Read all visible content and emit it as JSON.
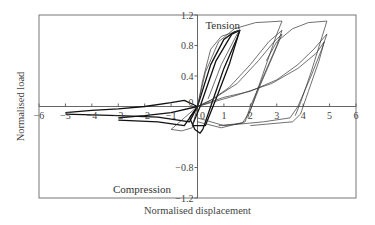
{
  "chart_data": {
    "type": "line",
    "title": "",
    "xlabel": "Normalised displacement",
    "ylabel": "Normalised load",
    "xlim": [
      -6,
      6
    ],
    "ylim": [
      -1.2,
      1.2
    ],
    "x_ticks": [
      -6,
      -5,
      -4,
      -3,
      -2,
      -1,
      0,
      1,
      2,
      3,
      4,
      5,
      6
    ],
    "y_ticks": [
      -1.2,
      -0.8,
      0,
      0.4,
      0.8,
      1.2
    ],
    "y_tick_labels": [
      "−1.2",
      "−0.8",
      "0",
      "0.4",
      "0.8",
      "1.2"
    ],
    "x_tick_labels": [
      "−6",
      "−5",
      "−4",
      "−3",
      "−2",
      "−1",
      "0",
      "1",
      "2",
      "3",
      "4",
      "5",
      "6"
    ],
    "grid": false,
    "legend": null,
    "annotations": [
      {
        "text": "Tension",
        "x": 0.3,
        "y": 1.12
      },
      {
        "text": "Compression",
        "x": -3.2,
        "y": -1.08
      }
    ],
    "series": [
      {
        "name": "cycle-1.6",
        "bold": true,
        "points": [
          [
            -0.3,
            -0.15
          ],
          [
            0,
            0
          ],
          [
            0.5,
            0.55
          ],
          [
            1.0,
            0.88
          ],
          [
            1.4,
            0.98
          ],
          [
            1.6,
            1.0
          ],
          [
            1.5,
            0.9
          ],
          [
            1.0,
            0.5
          ],
          [
            0.55,
            0.05
          ],
          [
            0.2,
            -0.3
          ],
          [
            0.1,
            -0.35
          ],
          [
            -0.1,
            -0.3
          ],
          [
            -0.3,
            -0.15
          ]
        ]
      },
      {
        "name": "cycle-1.6b",
        "bold": true,
        "points": [
          [
            -0.2,
            -0.25
          ],
          [
            0.1,
            0
          ],
          [
            0.7,
            0.6
          ],
          [
            1.3,
            0.95
          ],
          [
            1.6,
            1.0
          ],
          [
            1.2,
            0.55
          ],
          [
            0.7,
            0.1
          ],
          [
            0.3,
            -0.25
          ],
          [
            -0.2,
            -0.25
          ]
        ]
      },
      {
        "name": "cycle-1.6c",
        "bold": false,
        "points": [
          [
            0,
            0
          ],
          [
            0.2,
            0.35
          ],
          [
            0.5,
            0.75
          ],
          [
            0.9,
            0.92
          ],
          [
            1.6,
            1.0
          ],
          [
            1.5,
            0.95
          ],
          [
            0.9,
            0.55
          ],
          [
            0.4,
            0.1
          ]
        ]
      },
      {
        "name": "cycle-3.2",
        "bold": false,
        "points": [
          [
            0,
            0
          ],
          [
            0.5,
            0.08
          ],
          [
            1.2,
            0.25
          ],
          [
            2.0,
            0.55
          ],
          [
            2.7,
            0.85
          ],
          [
            3.2,
            1.0
          ],
          [
            3.0,
            0.8
          ],
          [
            2.5,
            0.4
          ],
          [
            2.0,
            0.0
          ],
          [
            1.8,
            -0.2
          ],
          [
            0.9,
            -0.28
          ],
          [
            0,
            -0.2
          ]
        ]
      },
      {
        "name": "cycle-3.2b",
        "bold": false,
        "points": [
          [
            0,
            0
          ],
          [
            0.6,
            0.1
          ],
          [
            1.5,
            0.3
          ],
          [
            2.3,
            0.6
          ],
          [
            2.9,
            0.85
          ],
          [
            3.2,
            0.95
          ],
          [
            2.9,
            0.7
          ],
          [
            2.4,
            0.3
          ],
          [
            2.0,
            -0.05
          ],
          [
            1.7,
            -0.22
          ],
          [
            0.8,
            -0.25
          ]
        ]
      },
      {
        "name": "cycle-3.2-env",
        "bold": false,
        "points": [
          [
            0,
            0
          ],
          [
            0.3,
            0.45
          ],
          [
            0.8,
            0.85
          ],
          [
            1.4,
            1.02
          ],
          [
            2.2,
            1.1
          ],
          [
            3.2,
            1.12
          ],
          [
            3.0,
            0.95
          ],
          [
            2.6,
            0.55
          ],
          [
            2.1,
            0.05
          ],
          [
            1.9,
            -0.15
          ]
        ]
      },
      {
        "name": "cycle-5",
        "bold": false,
        "points": [
          [
            0,
            0
          ],
          [
            1.0,
            0.12
          ],
          [
            2.0,
            0.2
          ],
          [
            3.0,
            0.35
          ],
          [
            3.8,
            0.55
          ],
          [
            4.4,
            0.75
          ],
          [
            4.9,
            0.95
          ],
          [
            4.7,
            0.75
          ],
          [
            4.3,
            0.4
          ],
          [
            3.8,
            0.0
          ],
          [
            3.5,
            -0.15
          ],
          [
            2.5,
            -0.2
          ],
          [
            1.0,
            -0.25
          ],
          [
            0,
            -0.15
          ]
        ]
      },
      {
        "name": "cycle-5b",
        "bold": false,
        "points": [
          [
            0,
            0
          ],
          [
            1.5,
            0.15
          ],
          [
            2.8,
            0.3
          ],
          [
            3.8,
            0.5
          ],
          [
            4.5,
            0.7
          ],
          [
            4.8,
            0.85
          ],
          [
            4.6,
            0.6
          ],
          [
            4.2,
            0.2
          ],
          [
            3.9,
            -0.1
          ],
          [
            3.6,
            -0.2
          ],
          [
            2.0,
            -0.25
          ]
        ]
      },
      {
        "name": "cycle-5-env",
        "bold": false,
        "points": [
          [
            2.6,
            0.6
          ],
          [
            3.0,
            0.85
          ],
          [
            3.6,
            1.02
          ],
          [
            4.2,
            1.1
          ],
          [
            4.9,
            1.12
          ],
          [
            4.7,
            0.9
          ],
          [
            4.3,
            0.45
          ],
          [
            3.9,
            0.05
          ],
          [
            3.7,
            -0.12
          ]
        ]
      },
      {
        "name": "compression-5",
        "bold": true,
        "points": [
          [
            -5.0,
            -0.08
          ],
          [
            -4.0,
            -0.05
          ],
          [
            -3.0,
            -0.03
          ],
          [
            -2.0,
            0.0
          ],
          [
            -1.0,
            0.05
          ],
          [
            -0.5,
            0.08
          ],
          [
            0,
            0.0
          ],
          [
            -0.3,
            -0.2
          ],
          [
            -1.5,
            -0.14
          ],
          [
            -3.0,
            -0.12
          ],
          [
            -5.0,
            -0.1
          ]
        ]
      },
      {
        "name": "compression-3",
        "bold": true,
        "points": [
          [
            -3.0,
            -0.15
          ],
          [
            -2.0,
            -0.12
          ],
          [
            -1.0,
            -0.08
          ],
          [
            0,
            0.0
          ],
          [
            -0.5,
            -0.25
          ],
          [
            -1.5,
            -0.2
          ],
          [
            -3.0,
            -0.18
          ]
        ]
      },
      {
        "name": "compression-1",
        "bold": false,
        "points": [
          [
            -1.0,
            -0.3
          ],
          [
            -0.5,
            -0.15
          ],
          [
            0,
            0
          ],
          [
            -0.2,
            -0.28
          ],
          [
            -0.6,
            -0.32
          ],
          [
            -1.0,
            -0.3
          ]
        ]
      }
    ]
  }
}
